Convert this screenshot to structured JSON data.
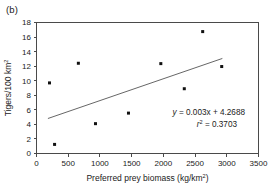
{
  "panel": {
    "label": "(b)"
  },
  "chart_data": {
    "type": "scatter",
    "title": "",
    "xlabel_main": "Preferred prey biomass (kg/km",
    "xlabel_sup": "2",
    "xlabel_tail": ")",
    "xlabel_full": "Preferred prey biomass (kg/km2)",
    "ylabel_main": "Tigers/100 km",
    "ylabel_sup": "2",
    "ylabel_full": "Tigers/100 km2",
    "xlim": [
      0,
      3500
    ],
    "ylim": [
      0,
      18
    ],
    "xticks": [
      0,
      500,
      1000,
      1500,
      2000,
      2500,
      3000,
      3500
    ],
    "yticks": [
      0,
      2,
      4,
      6,
      8,
      10,
      12,
      14,
      16,
      18
    ],
    "xtick_labels": [
      "0",
      "500",
      "1000",
      "1500",
      "2000",
      "2500",
      "3000",
      "3500"
    ],
    "ytick_labels": [
      "0",
      "2",
      "4",
      "6",
      "8",
      "10",
      "12",
      "14",
      "16",
      "18"
    ],
    "grid": false,
    "legend": null,
    "points": [
      {
        "x": 205,
        "y": 9.7
      },
      {
        "x": 285,
        "y": 1.25
      },
      {
        "x": 660,
        "y": 12.4
      },
      {
        "x": 930,
        "y": 4.1
      },
      {
        "x": 1450,
        "y": 5.55
      },
      {
        "x": 1960,
        "y": 12.35
      },
      {
        "x": 2330,
        "y": 8.9
      },
      {
        "x": 2620,
        "y": 16.75
      },
      {
        "x": 2920,
        "y": 11.95
      }
    ],
    "trendline": {
      "slope": 0.003,
      "intercept": 4.2688,
      "x_start": 180,
      "x_end": 2930
    },
    "annotations": {
      "equation_y": "y",
      "equation_body": " = 0.003x + 4.2688",
      "equation_full": "y = 0.003x + 4.2688",
      "r2_symbol": "r",
      "r2_sup": "2",
      "r2_value": " = 0.3703",
      "r2_full": "r2 = 0.3703"
    },
    "colors": {
      "point": "#111111",
      "line": "#555555",
      "axis": "#4a4a4a",
      "text": "#1a1a1a",
      "background": "#ffffff"
    }
  }
}
